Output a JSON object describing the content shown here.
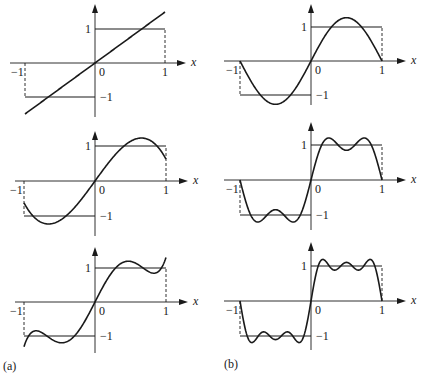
{
  "figure": {
    "labels": {
      "a": "(a)",
      "b": "(b)"
    },
    "ticks": {
      "neg_one_x": "−1",
      "zero": "0",
      "one_x": "1",
      "one_y": "1",
      "neg_one_y": "−1",
      "x_axis": "x"
    },
    "colors": {
      "ink": "#1a1a1a",
      "background": "#ffffff"
    }
  },
  "chart_data": [
    {
      "type": "line",
      "panel": "a-top",
      "title": "",
      "xlabel": "x",
      "ylabel": "",
      "xlim": [
        -1,
        1
      ],
      "ylim": [
        -1.6,
        1.6
      ],
      "tick_labels": {
        "x": [
          "-1",
          "0",
          "1"
        ],
        "y": [
          "1",
          "-1"
        ]
      },
      "series": [
        {
          "name": "square wave sgn(x)",
          "x": [
            -1,
            0,
            0,
            1
          ],
          "values": [
            -1,
            -1,
            1,
            1
          ]
        },
        {
          "name": "Legendre approximation (1 term)",
          "formula": "1.5*P1(x)",
          "x": [
            -1,
            -0.5,
            0,
            0.5,
            1
          ],
          "values": [
            -1.5,
            -0.75,
            0,
            0.75,
            1.5
          ]
        }
      ]
    },
    {
      "type": "line",
      "panel": "a-middle",
      "xlabel": "x",
      "xlim": [
        -1,
        1
      ],
      "ylim": [
        -1.6,
        1.6
      ],
      "tick_labels": {
        "x": [
          "-1",
          "0",
          "1"
        ],
        "y": [
          "1",
          "-1"
        ]
      },
      "series": [
        {
          "name": "square wave sgn(x)",
          "x": [
            -1,
            0,
            0,
            1
          ],
          "values": [
            -1,
            -1,
            1,
            1
          ]
        },
        {
          "name": "Legendre approximation (2 terms)",
          "formula": "1.5*P1(x) - 0.875*P3(x)",
          "x": [
            -1,
            -0.75,
            -0.5,
            -0.25,
            0,
            0.25,
            0.5,
            0.75,
            1
          ],
          "values": [
            -0.625,
            -1.19,
            -1.05,
            -0.59,
            0,
            0.59,
            1.05,
            1.19,
            0.625
          ]
        }
      ]
    },
    {
      "type": "line",
      "panel": "a-bottom",
      "xlabel": "x",
      "xlim": [
        -1,
        1
      ],
      "ylim": [
        -1.6,
        1.6
      ],
      "tick_labels": {
        "x": [
          "-1",
          "0",
          "1"
        ],
        "y": [
          "1",
          "-1"
        ]
      },
      "series": [
        {
          "name": "square wave sgn(x)",
          "x": [
            -1,
            0,
            0,
            1
          ],
          "values": [
            -1,
            -1,
            1,
            1
          ]
        },
        {
          "name": "Legendre approximation (3 terms)",
          "formula": "1.5*P1(x) - 0.875*P3(x) + 0.6875*P5(x)",
          "x": [
            -1,
            -0.75,
            -0.5,
            -0.25,
            0,
            0.25,
            0.5,
            0.75,
            1
          ],
          "values": [
            -1.31,
            -0.96,
            -1.14,
            -0.79,
            0,
            0.79,
            1.14,
            0.96,
            1.31
          ]
        }
      ]
    },
    {
      "type": "line",
      "panel": "b-top",
      "xlabel": "x",
      "xlim": [
        -1,
        1
      ],
      "ylim": [
        -1.6,
        1.6
      ],
      "tick_labels": {
        "x": [
          "-1",
          "0",
          "1"
        ],
        "y": [
          "1",
          "-1"
        ]
      },
      "series": [
        {
          "name": "square wave sgn(x)",
          "x": [
            -1,
            0,
            0,
            1
          ],
          "values": [
            -1,
            -1,
            1,
            1
          ]
        },
        {
          "name": "Fourier sine approximation (1 term)",
          "formula": "(4/pi)*sin(pi x)",
          "x": [
            -1,
            -0.5,
            0,
            0.5,
            1
          ],
          "values": [
            0,
            -1.27,
            0,
            1.27,
            0
          ]
        }
      ]
    },
    {
      "type": "line",
      "panel": "b-middle",
      "xlabel": "x",
      "xlim": [
        -1,
        1
      ],
      "ylim": [
        -1.6,
        1.6
      ],
      "tick_labels": {
        "x": [
          "-1",
          "0",
          "1"
        ],
        "y": [
          "1",
          "-1"
        ]
      },
      "series": [
        {
          "name": "square wave sgn(x)",
          "x": [
            -1,
            0,
            0,
            1
          ],
          "values": [
            -1,
            -1,
            1,
            1
          ]
        },
        {
          "name": "Fourier sine approximation (2 terms)",
          "formula": "(4/pi)*(sin(pi x) + sin(3 pi x)/3)",
          "x": [
            -1,
            -0.75,
            -0.5,
            -0.25,
            0,
            0.25,
            0.5,
            0.75,
            1
          ],
          "values": [
            0,
            -1.2,
            -0.85,
            -1.2,
            0,
            1.2,
            0.85,
            1.2,
            0
          ]
        }
      ]
    },
    {
      "type": "line",
      "panel": "b-bottom",
      "xlabel": "x",
      "xlim": [
        -1,
        1
      ],
      "ylim": [
        -1.6,
        1.6
      ],
      "tick_labels": {
        "x": [
          "-1",
          "0",
          "1"
        ],
        "y": [
          "1",
          "-1"
        ]
      },
      "series": [
        {
          "name": "square wave sgn(x)",
          "x": [
            -1,
            0,
            0,
            1
          ],
          "values": [
            -1,
            -1,
            1,
            1
          ]
        },
        {
          "name": "Fourier sine approximation (3 terms)",
          "formula": "(4/pi)*(sin(pi x) + sin(3 pi x)/3 + sin(5 pi x)/5)",
          "x": [
            -1,
            -0.75,
            -0.5,
            -0.25,
            0,
            0.25,
            0.5,
            0.75,
            1
          ],
          "values": [
            0,
            -0.84,
            -1.1,
            -0.84,
            0,
            0.84,
            1.1,
            0.84,
            0
          ]
        }
      ]
    }
  ],
  "layout": {
    "panels": [
      {
        "id": "a-top",
        "kind": "legendre",
        "terms": 1,
        "ox": 95,
        "oy": 63,
        "sx": 70,
        "sy": 34,
        "axis_left": 10,
        "axis_right": 186,
        "yaxis_top": 4,
        "yaxis_bottom": 117
      },
      {
        "id": "a-middle",
        "kind": "legendre",
        "terms": 2,
        "ox": 95,
        "oy": 181,
        "sx": 71,
        "sy": 35,
        "axis_left": 15,
        "axis_right": 188,
        "yaxis_top": 131,
        "yaxis_bottom": 236
      },
      {
        "id": "a-bottom",
        "kind": "legendre",
        "terms": 3,
        "ox": 95,
        "oy": 302,
        "sx": 71,
        "sy": 34,
        "axis_left": 15,
        "axis_right": 188,
        "yaxis_top": 247,
        "yaxis_bottom": 353
      },
      {
        "id": "b-top",
        "kind": "fourier",
        "terms": 1,
        "ox": 311,
        "oy": 61,
        "sx": 71,
        "sy": 34,
        "axis_left": 224,
        "axis_right": 406,
        "yaxis_top": 4,
        "yaxis_bottom": 105
      },
      {
        "id": "b-middle",
        "kind": "fourier",
        "terms": 2,
        "ox": 311,
        "oy": 180,
        "sx": 71,
        "sy": 35,
        "axis_left": 224,
        "axis_right": 406,
        "yaxis_top": 122,
        "yaxis_bottom": 230
      },
      {
        "id": "b-bottom",
        "kind": "fourier",
        "terms": 3,
        "ox": 311,
        "oy": 301,
        "sx": 71,
        "sy": 35,
        "axis_left": 224,
        "axis_right": 406,
        "yaxis_top": 242,
        "yaxis_bottom": 350
      }
    ]
  }
}
